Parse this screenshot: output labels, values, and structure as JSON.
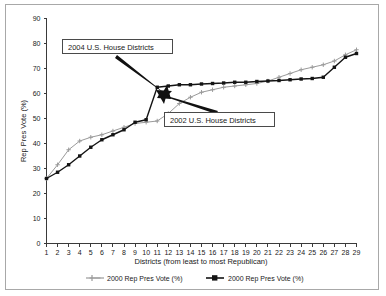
{
  "chart_data": {
    "type": "line",
    "title": "",
    "xlabel": "Districts (from least to most Republican)",
    "ylabel": "Rep Pres Vote (%)",
    "xlim": [
      1,
      29
    ],
    "ylim": [
      0,
      90
    ],
    "ytick_step": 10,
    "grid": false,
    "legend_position": "bottom",
    "x": [
      1,
      2,
      3,
      4,
      5,
      6,
      7,
      8,
      9,
      10,
      11,
      12,
      13,
      14,
      15,
      16,
      17,
      18,
      19,
      20,
      21,
      22,
      23,
      24,
      25,
      26,
      27,
      28,
      29
    ],
    "xticklabels": [
      "1",
      "2",
      "3",
      "4",
      "5",
      "6",
      "7",
      "8",
      "9",
      "10",
      "11",
      "12",
      "13",
      "14",
      "15",
      "16",
      "17",
      "18",
      "19",
      "20",
      "21",
      "22",
      "23",
      "24",
      "25",
      "26",
      "27",
      "28",
      "29"
    ],
    "yticklabels": [
      "0",
      "10",
      "20",
      "30",
      "40",
      "50",
      "60",
      "70",
      "80",
      "90"
    ],
    "series": [
      {
        "name": "2000 Rep Pres Vote (%)",
        "style": "gray-line-cross-marker",
        "color": "#9a9a9a",
        "annotation": "2002 U.S. House Districts",
        "values": [
          26.0,
          31.5,
          37.5,
          41.0,
          42.5,
          43.5,
          45.0,
          46.5,
          48.0,
          48.5,
          49.0,
          52.0,
          56.0,
          58.5,
          60.5,
          61.5,
          62.5,
          63.0,
          63.5,
          64.0,
          65.0,
          66.5,
          68.0,
          69.5,
          70.5,
          71.5,
          73.0,
          75.5,
          77.5
        ]
      },
      {
        "name": "2000 Rep Pres Vote (%)",
        "style": "black-line-square-marker",
        "color": "#141414",
        "annotation": "2004 U.S. House Districts",
        "values": [
          26.0,
          28.5,
          31.5,
          35.0,
          38.5,
          41.5,
          43.5,
          45.5,
          48.5,
          49.5,
          62.5,
          63.0,
          63.5,
          63.5,
          63.8,
          64.0,
          64.2,
          64.5,
          64.5,
          64.8,
          65.0,
          65.2,
          65.5,
          65.8,
          66.0,
          66.5,
          70.5,
          74.5,
          76.0
        ]
      }
    ],
    "annotations": [
      {
        "id": "callout-2004",
        "label": "2004 U.S. House Districts",
        "points_to_series": 1,
        "points_to_x": 11
      },
      {
        "id": "callout-2002",
        "label": "2002 U.S. House Districts",
        "points_to_series": 0,
        "points_to_x": 12
      }
    ],
    "legend": [
      {
        "label": "2000 Rep Pres Vote (%)",
        "color": "#9a9a9a",
        "marker": "cross"
      },
      {
        "label": "2000 Rep Pres Vote (%)",
        "color": "#141414",
        "marker": "square"
      }
    ],
    "colors": {
      "series_a": "#9a9a9a",
      "series_b": "#141414",
      "axis": "#3a3a3a",
      "text": "#1a1a1a",
      "frame": "#a8a8a8",
      "background": "#ffffff"
    }
  }
}
